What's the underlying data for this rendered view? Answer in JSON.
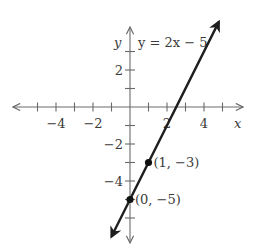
{
  "chart_data": {
    "type": "line",
    "title": "",
    "equation_label": "y = 2x − 5",
    "xlabel": "x",
    "ylabel": "y",
    "xlim": [
      -6,
      6
    ],
    "ylim": [
      -7,
      4
    ],
    "x_tick_labels": [
      {
        "value": -4,
        "text": "−4"
      },
      {
        "value": -2,
        "text": "−2"
      },
      {
        "value": 2,
        "text": "2"
      },
      {
        "value": 4,
        "text": "4"
      }
    ],
    "y_tick_labels": [
      {
        "value": 2,
        "text": "2"
      },
      {
        "value": -2,
        "text": "−2"
      },
      {
        "value": -4,
        "text": "−4"
      }
    ],
    "x_ticks": [
      -5,
      -4,
      -3,
      -2,
      -1,
      1,
      2,
      3,
      4,
      5
    ],
    "y_ticks": [
      3,
      2,
      1,
      -1,
      -2,
      -3,
      -4,
      -5,
      -6
    ],
    "grid": false,
    "series": [
      {
        "name": "y = 2x − 5",
        "slope": 2,
        "intercept": -5,
        "x": [
          -1,
          4.8
        ],
        "y": [
          -7,
          4.6
        ]
      }
    ],
    "points": [
      {
        "x": 1,
        "y": -3,
        "label": "(1, −3)"
      },
      {
        "x": 0,
        "y": -5,
        "label": "(0, −5)"
      }
    ]
  }
}
